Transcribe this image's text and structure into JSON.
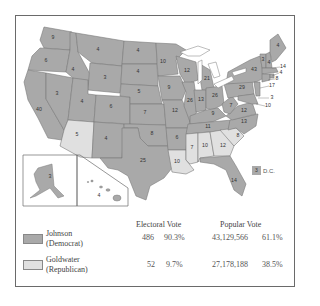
{
  "map": {
    "title": "1964 Presidential Election Results",
    "colors": {
      "democrat": "#a9a9a9",
      "republican": "#e0e0e0",
      "border": "#7a7a7a",
      "water": "#ffffff"
    },
    "states": [
      {
        "abbr": "WA",
        "ev": "9",
        "winner": "Johnson"
      },
      {
        "abbr": "OR",
        "ev": "6",
        "winner": "Johnson"
      },
      {
        "abbr": "CA",
        "ev": "40",
        "winner": "Johnson"
      },
      {
        "abbr": "NV",
        "ev": "3",
        "winner": "Johnson"
      },
      {
        "abbr": "ID",
        "ev": "4",
        "winner": "Johnson"
      },
      {
        "abbr": "MT",
        "ev": "4",
        "winner": "Johnson"
      },
      {
        "abbr": "WY",
        "ev": "3",
        "winner": "Johnson"
      },
      {
        "abbr": "UT",
        "ev": "4",
        "winner": "Johnson"
      },
      {
        "abbr": "AZ",
        "ev": "5",
        "winner": "Goldwater"
      },
      {
        "abbr": "CO",
        "ev": "6",
        "winner": "Johnson"
      },
      {
        "abbr": "NM",
        "ev": "4",
        "winner": "Johnson"
      },
      {
        "abbr": "ND",
        "ev": "4",
        "winner": "Johnson"
      },
      {
        "abbr": "SD",
        "ev": "4",
        "winner": "Johnson"
      },
      {
        "abbr": "NE",
        "ev": "5",
        "winner": "Johnson"
      },
      {
        "abbr": "KS",
        "ev": "7",
        "winner": "Johnson"
      },
      {
        "abbr": "OK",
        "ev": "8",
        "winner": "Johnson"
      },
      {
        "abbr": "TX",
        "ev": "25",
        "winner": "Johnson"
      },
      {
        "abbr": "MN",
        "ev": "10",
        "winner": "Johnson"
      },
      {
        "abbr": "IA",
        "ev": "9",
        "winner": "Johnson"
      },
      {
        "abbr": "MO",
        "ev": "12",
        "winner": "Johnson"
      },
      {
        "abbr": "AR",
        "ev": "6",
        "winner": "Johnson"
      },
      {
        "abbr": "LA",
        "ev": "10",
        "winner": "Goldwater"
      },
      {
        "abbr": "WI",
        "ev": "12",
        "winner": "Johnson"
      },
      {
        "abbr": "IL",
        "ev": "26",
        "winner": "Johnson"
      },
      {
        "abbr": "MI",
        "ev": "21",
        "winner": "Johnson"
      },
      {
        "abbr": "IN",
        "ev": "13",
        "winner": "Johnson"
      },
      {
        "abbr": "OH",
        "ev": "26",
        "winner": "Johnson"
      },
      {
        "abbr": "KY",
        "ev": "9",
        "winner": "Johnson"
      },
      {
        "abbr": "TN",
        "ev": "11",
        "winner": "Johnson"
      },
      {
        "abbr": "MS",
        "ev": "7",
        "winner": "Goldwater"
      },
      {
        "abbr": "AL",
        "ev": "10",
        "winner": "Goldwater"
      },
      {
        "abbr": "GA",
        "ev": "12",
        "winner": "Goldwater"
      },
      {
        "abbr": "FL",
        "ev": "14",
        "winner": "Johnson"
      },
      {
        "abbr": "SC",
        "ev": "8",
        "winner": "Goldwater"
      },
      {
        "abbr": "NC",
        "ev": "13",
        "winner": "Johnson"
      },
      {
        "abbr": "VA",
        "ev": "12",
        "winner": "Johnson"
      },
      {
        "abbr": "WV",
        "ev": "7",
        "winner": "Johnson"
      },
      {
        "abbr": "PA",
        "ev": "29",
        "winner": "Johnson"
      },
      {
        "abbr": "NY",
        "ev": "43",
        "winner": "Johnson"
      },
      {
        "abbr": "VT",
        "ev": "3",
        "winner": "Johnson"
      },
      {
        "abbr": "NH",
        "ev": "4",
        "winner": "Johnson"
      },
      {
        "abbr": "ME",
        "ev": "4",
        "winner": "Johnson"
      },
      {
        "abbr": "MA",
        "ev": "14",
        "winner": "Johnson"
      },
      {
        "abbr": "RI",
        "ev": "4",
        "winner": "Johnson"
      },
      {
        "abbr": "CT",
        "ev": "8",
        "winner": "Johnson"
      },
      {
        "abbr": "NJ",
        "ev": "17",
        "winner": "Johnson"
      },
      {
        "abbr": "DE",
        "ev": "3",
        "winner": "Johnson"
      },
      {
        "abbr": "MD",
        "ev": "10",
        "winner": "Johnson"
      },
      {
        "abbr": "AK",
        "ev": "3",
        "winner": "Johnson"
      },
      {
        "abbr": "HI",
        "ev": "4",
        "winner": "Johnson"
      }
    ],
    "dc": {
      "ev": "3",
      "label": "D.C."
    }
  },
  "legend": {
    "headers": {
      "electoral": "Electoral Vote",
      "popular": "Popular Vote"
    },
    "rows": [
      {
        "name": "Johnson",
        "party": "(Democrat)",
        "ev": "486",
        "ev_pct": "90.3%",
        "pop": "43,129,566",
        "pop_pct": "61.1%"
      },
      {
        "name": "Goldwater",
        "party": "(Republican)",
        "ev": "52",
        "ev_pct": "9.7%",
        "pop": "27,178,188",
        "pop_pct": "38.5%"
      }
    ]
  }
}
